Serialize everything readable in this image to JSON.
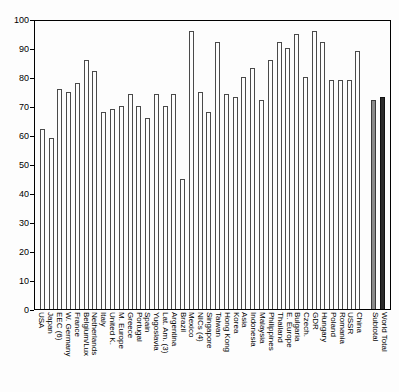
{
  "chart_data": {
    "type": "bar",
    "title": "",
    "subtitle": "",
    "xlabel": "",
    "ylabel": "",
    "ylim": [
      0,
      100
    ],
    "yticks": [
      0,
      10,
      20,
      30,
      40,
      50,
      60,
      70,
      80,
      90,
      100
    ],
    "grid": false,
    "legend": "none",
    "categories": [
      "USA",
      "Japan",
      "EEC (6)",
      "W. Germany",
      "France",
      "Belgium/Lux",
      "Netherlands",
      "Italy",
      "United K.",
      "M. Europe",
      "Greece",
      "Portugal",
      "Spain",
      "Yugoslavia",
      "Lat. Am. (3)",
      "Argentina",
      "Brazil",
      "Mexico",
      "NICs (4)",
      "Singapore",
      "Taiwan",
      "Hong Kong",
      "Korea",
      "Asia",
      "Indonesia",
      "Malaysia",
      "Philippines",
      "Thailand",
      "E. Europe",
      "Bulgaria",
      "Czech.",
      "GDR",
      "Hungary",
      "Poland",
      "Romania",
      "USSR",
      "China",
      "Subtotal",
      "World Total"
    ],
    "values": [
      62,
      59,
      76,
      75,
      78,
      86,
      82,
      68,
      69,
      70,
      74,
      70,
      66,
      74,
      70,
      74,
      45,
      96,
      75,
      68,
      92,
      74,
      73,
      80,
      83,
      72,
      86,
      92,
      90,
      95,
      80,
      96,
      92,
      79,
      79,
      79,
      89,
      72,
      73
    ],
    "bar_styles": {
      "default": "outline",
      "filled_gray": [
        "Subtotal"
      ],
      "filled_dark": [
        "World Total"
      ]
    },
    "separator_after": "China",
    "colors": {
      "background": "#fdfdfd",
      "axis": "#000000",
      "bar_outline": "#4a4a4a",
      "bar_subtotal": "#8a8a8a",
      "bar_world_total": "#2b2b2b"
    }
  }
}
